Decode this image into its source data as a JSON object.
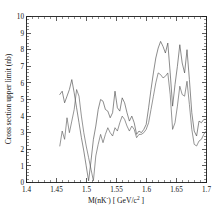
{
  "figure": {
    "background_color": "#ffffff",
    "frame_color": "#1a1a1a",
    "curve_color": "#4d4d4d"
  },
  "axes": {
    "x_title_main": "M(nK",
    "x_title_sup": "-",
    "x_title_tail": ") [ GeV/c",
    "x_title_tail_sup": "2",
    "x_title_end": " ]",
    "y_title": "Cross section upper limit (nb)",
    "x_ticks": [
      "1.4",
      "1.45",
      "1.5",
      "1.55",
      "1.6",
      "1.65",
      "1.7"
    ],
    "y_ticks": [
      "0",
      "1",
      "2",
      "3",
      "4",
      "5",
      "6",
      "7",
      "8",
      "9",
      "10"
    ]
  },
  "chart_data": {
    "type": "line",
    "title": "",
    "xlabel": "M(nK-) [ GeV/c2 ]",
    "ylabel": "Cross section upper limit (nb)",
    "xlim": [
      1.4,
      1.7
    ],
    "ylim": [
      0,
      10
    ],
    "x_tick_values": [
      1.4,
      1.45,
      1.5,
      1.55,
      1.6,
      1.65,
      1.7
    ],
    "y_tick_values": [
      0,
      1,
      2,
      3,
      4,
      5,
      6,
      7,
      8,
      9,
      10
    ],
    "x_minor_tick_step": 0.01,
    "y_minor_tick_step": 0.2,
    "grid": false,
    "legend": false,
    "series": [
      {
        "name": "upper limit curve A",
        "x": [
          1.4555,
          1.4595,
          1.4635,
          1.4675,
          1.4715,
          1.4755,
          1.4795,
          1.4835,
          1.4875,
          1.4915,
          1.4955,
          1.4995,
          1.5035,
          1.5075,
          1.5115,
          1.5155,
          1.5195,
          1.5235,
          1.5275,
          1.5315,
          1.5355,
          1.5395,
          1.5435,
          1.5475,
          1.5515,
          1.5555,
          1.5595,
          1.5635,
          1.5675,
          1.5715,
          1.5755,
          1.5795,
          1.5835,
          1.5875,
          1.5915,
          1.5955,
          1.5995,
          1.6035,
          1.6075,
          1.6115,
          1.6155,
          1.6195,
          1.6235,
          1.6275,
          1.6315,
          1.6355,
          1.6395,
          1.6435,
          1.6475,
          1.6515,
          1.6555,
          1.6595,
          1.6635,
          1.6675,
          1.6715,
          1.6755,
          1.6795,
          1.6835,
          1.6875,
          1.6915,
          1.6955,
          1.6995
        ],
        "y": [
          5.3,
          5.5,
          4.8,
          5.2,
          5.6,
          6.2,
          5.4,
          4.5,
          3.6,
          2.7,
          1.9,
          1.0,
          0.1,
          1.3,
          2.6,
          3.4,
          4.4,
          5.0,
          4.9,
          4.4,
          4.3,
          3.9,
          4.2,
          5.5,
          4.5,
          4.3,
          5.1,
          4.8,
          4.2,
          3.7,
          4.0,
          3.6,
          2.9,
          3.1,
          3.0,
          3.2,
          3.5,
          4.5,
          5.6,
          6.6,
          7.5,
          8.1,
          8.5,
          8.2,
          7.8,
          8.4,
          6.6,
          4.6,
          5.9,
          7.0,
          8.3,
          7.2,
          6.6,
          8.0,
          6.2,
          4.2,
          3.1,
          2.8,
          3.7,
          3.6,
          3.8,
          3.8
        ]
      },
      {
        "name": "upper limit curve B",
        "x": [
          1.4555,
          1.4595,
          1.4635,
          1.4675,
          1.4715,
          1.4755,
          1.4795,
          1.4835,
          1.4875,
          1.4915,
          1.4955,
          1.4995,
          1.5035,
          1.5075,
          1.5115,
          1.5155,
          1.5195,
          1.5235,
          1.5275,
          1.5315,
          1.5355,
          1.5395,
          1.5435,
          1.5475,
          1.5515,
          1.5555,
          1.5595,
          1.5635,
          1.5675,
          1.5715,
          1.5755,
          1.5795,
          1.5835,
          1.5875,
          1.5915,
          1.5955,
          1.5995,
          1.6035,
          1.6075,
          1.6115,
          1.6155,
          1.6195,
          1.6235,
          1.6275,
          1.6315,
          1.6355,
          1.6395,
          1.6435,
          1.6475,
          1.6515,
          1.6555,
          1.6595,
          1.6635,
          1.6675,
          1.6715,
          1.6755,
          1.6795,
          1.6835,
          1.6875,
          1.6915,
          1.6955,
          1.6995
        ],
        "y": [
          2.2,
          3.1,
          2.6,
          3.9,
          3.0,
          3.7,
          4.4,
          5.6,
          5.2,
          4.0,
          3.0,
          2.2,
          1.5,
          0.8,
          0.1,
          1.6,
          2.3,
          2.9,
          2.4,
          2.9,
          3.3,
          3.0,
          2.8,
          3.3,
          3.1,
          3.6,
          4.0,
          3.8,
          3.4,
          3.1,
          3.4,
          3.2,
          2.7,
          2.9,
          2.9,
          3.0,
          3.2,
          3.6,
          4.4,
          5.2,
          6.0,
          6.6,
          6.5,
          6.3,
          6.4,
          6.6,
          5.3,
          3.2,
          3.6,
          4.6,
          5.8,
          5.3,
          5.2,
          6.1,
          4.7,
          3.2,
          2.3,
          2.2,
          2.5,
          2.6,
          2.9,
          3.1
        ]
      }
    ]
  }
}
